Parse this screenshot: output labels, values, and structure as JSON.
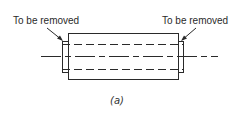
{
  "diagram": {
    "labels": {
      "left": "To be removed",
      "right": "To be removed"
    },
    "caption": "(a)",
    "colors": {
      "stroke": "#2a2a2a",
      "background": "#ffffff"
    }
  }
}
